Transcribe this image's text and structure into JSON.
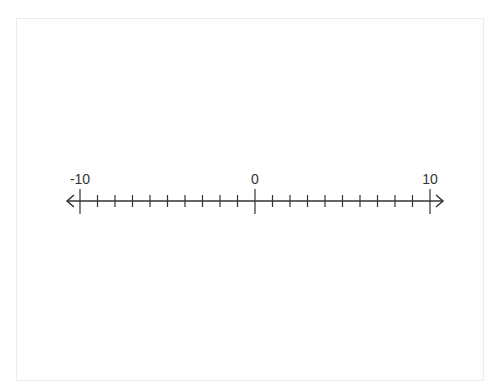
{
  "diagram": {
    "type": "number-line",
    "min": -10,
    "max": 10,
    "step": 1,
    "labels": [
      {
        "value": -10,
        "text": "-10"
      },
      {
        "value": 0,
        "text": "0"
      },
      {
        "value": 10,
        "text": "10"
      }
    ],
    "arrows": {
      "left": true,
      "right": true
    },
    "line_color": "#333333"
  }
}
